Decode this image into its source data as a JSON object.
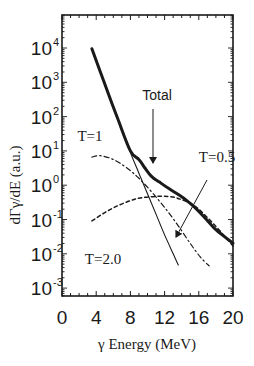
{
  "chart_data": {
    "type": "line",
    "title": "",
    "xlabel": "γ Energy (MeV)",
    "ylabel": "dΓγ/dE (a.u.)",
    "xlim": [
      0,
      20
    ],
    "ylim_log10": [
      -3.3,
      4.9
    ],
    "yscale": "log",
    "grid": false,
    "x_ticks": [
      0,
      4,
      8,
      12,
      16,
      20
    ],
    "y_ticks": [
      {
        "base": "10",
        "exp": "4",
        "log": 4
      },
      {
        "base": "10",
        "exp": "3",
        "log": 3
      },
      {
        "base": "10",
        "exp": "2",
        "log": 2
      },
      {
        "base": "10",
        "exp": "1",
        "log": 1
      },
      {
        "base": "10",
        "exp": "0",
        "log": 0
      },
      {
        "base": "10",
        "exp": "-1",
        "log": -1
      },
      {
        "base": "10",
        "exp": "-2",
        "log": -2
      },
      {
        "base": "10",
        "exp": "-3",
        "log": -3
      }
    ],
    "series": [
      {
        "name": "Total",
        "style": "thick-solid",
        "x": [
          3.5,
          5,
          6.5,
          8,
          9,
          9.7,
          10.5,
          11.4,
          12.5,
          13.7,
          14.6,
          15.5,
          16.7,
          17.8,
          19,
          20
        ],
        "log10_y": [
          3.98,
          2.95,
          1.95,
          1.0,
          0.75,
          0.5,
          0.25,
          0.09,
          -0.1,
          -0.29,
          -0.45,
          -0.64,
          -0.95,
          -1.25,
          -1.5,
          -1.69
        ]
      },
      {
        "name": "T=0.5",
        "style": "thin-solid",
        "x": [
          3.5,
          6,
          8,
          9,
          10,
          11,
          12,
          13,
          13.6
        ],
        "log10_y": [
          3.98,
          2.25,
          0.95,
          0.35,
          -0.25,
          -0.85,
          -1.45,
          -2.0,
          -2.33
        ]
      },
      {
        "name": "T=1",
        "style": "dash-dot",
        "x": [
          3.5,
          4.5,
          6,
          7.5,
          9,
          10.5,
          12,
          13.5,
          15,
          16.2,
          17.2
        ],
        "log10_y": [
          0.82,
          0.86,
          0.75,
          0.52,
          0.2,
          -0.2,
          -0.65,
          -1.15,
          -1.7,
          -2.1,
          -2.35
        ]
      },
      {
        "name": "T=2.0",
        "style": "dashed",
        "x": [
          3.5,
          5,
          6.5,
          8,
          9,
          10.2,
          11.5,
          12.5,
          13.5,
          15.5,
          17.8,
          20
        ],
        "log10_y": [
          -1.04,
          -0.8,
          -0.6,
          -0.45,
          -0.38,
          -0.34,
          -0.32,
          -0.33,
          -0.38,
          -0.6,
          -1.15,
          -1.77
        ]
      }
    ],
    "annotations": [
      {
        "text": "Total",
        "font": "sans",
        "x": 157,
        "y": 100,
        "arrow": {
          "x1": 153,
          "y1": 109,
          "x2": 153,
          "y2": 163
        }
      },
      {
        "text": "T=1",
        "font": "serif",
        "x": 90,
        "y": 141
      },
      {
        "text": "T=0.5",
        "font": "serif",
        "x": 217,
        "y": 162,
        "arrow": {
          "x1": 207,
          "y1": 180,
          "x2": 176,
          "y2": 237
        }
      },
      {
        "text": "T=2.0",
        "font": "serif",
        "x": 103,
        "y": 264
      }
    ]
  }
}
